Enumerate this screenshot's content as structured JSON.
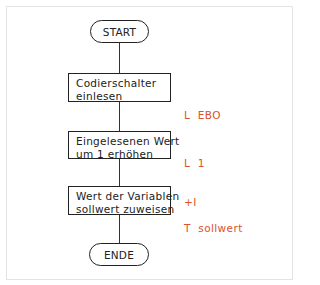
{
  "diagram": {
    "type": "flowchart",
    "colors": {
      "line": "#222222",
      "annotation": "#d9532c",
      "frame": "#e3e3e3"
    },
    "start": {
      "label": "START"
    },
    "steps": [
      {
        "lines": [
          "Codierschalter",
          "einlesen"
        ],
        "annotation": [
          "L  EBO"
        ]
      },
      {
        "lines": [
          "Eingelesenen  Wert",
          "um  1  erhöhen"
        ],
        "annotation": [
          "L  1",
          "+I"
        ]
      },
      {
        "lines": [
          "Wert  der  Variablen",
          "sollwert  zuweisen"
        ],
        "annotation": [
          "T  sollwert"
        ]
      }
    ],
    "end": {
      "label": "ENDE"
    }
  }
}
